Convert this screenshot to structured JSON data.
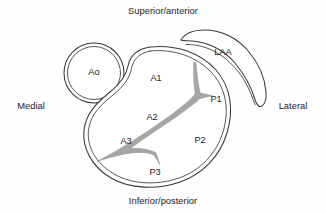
{
  "diagram": {
    "background_color": "#fefefe",
    "outline_color": "#3a3a3a",
    "coaptation_color": "#a6a6a6",
    "text_color": "#1c1c1c"
  },
  "orientation_labels": {
    "top": "Superior/anterior",
    "bottom": "Inferior/posterior",
    "left": "Medial",
    "right": "Lateral"
  },
  "structures": {
    "aorta": "Ao",
    "left_atrial_appendage": "LAA"
  },
  "scallops": {
    "anterior": [
      {
        "id": "A1",
        "label": "A1"
      },
      {
        "id": "A2",
        "label": "A2"
      },
      {
        "id": "A3",
        "label": "A3"
      }
    ],
    "posterior": [
      {
        "id": "P1",
        "label": "P1"
      },
      {
        "id": "P2",
        "label": "P2"
      },
      {
        "id": "P3",
        "label": "P3"
      }
    ]
  }
}
